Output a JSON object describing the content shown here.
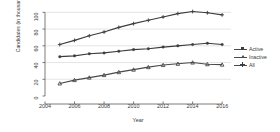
{
  "chart_data": {
    "type": "line",
    "title": "",
    "xlabel": "Year",
    "ylabel": "Candidates (in thousands)",
    "xlim": [
      2004,
      2016.6
    ],
    "ylim": [
      0,
      104
    ],
    "xticks": [
      2004,
      2006,
      2008,
      2010,
      2012,
      2014,
      2016
    ],
    "yticks": [
      0,
      20,
      40,
      60,
      80,
      100
    ],
    "grid": "horizontal",
    "legend_position": "right",
    "x": [
      2005,
      2006,
      2007,
      2008,
      2009,
      2010,
      2011,
      2012,
      2013,
      2014,
      2015,
      2016
    ],
    "series": [
      {
        "name": "Active",
        "marker": "circle",
        "color": "#3c3c3c",
        "values": [
          47,
          48,
          50.5,
          51.5,
          53.5,
          55.5,
          56.5,
          58.5,
          60,
          61.5,
          63,
          61.5
        ]
      },
      {
        "name": "Inactive",
        "marker": "triangle",
        "color": "#4a4a4a",
        "values": [
          15,
          19,
          22,
          25,
          28.5,
          31.5,
          34.5,
          37,
          38.5,
          40,
          38,
          37.5
        ]
      },
      {
        "name": "All",
        "marker": "plus",
        "color": "#3c3c3c",
        "values": [
          61.5,
          66.5,
          72,
          76.5,
          82,
          86.5,
          90.5,
          94.5,
          98.5,
          101,
          99.5,
          97
        ]
      }
    ]
  },
  "legend": {
    "items": [
      {
        "label": "Active"
      },
      {
        "label": "Inactive"
      },
      {
        "label": "All"
      }
    ]
  },
  "colors": {
    "axis": "#5a5a5a",
    "grid": "#d8d8d8",
    "text": "#3a3a3a",
    "background": "#ffffff"
  }
}
